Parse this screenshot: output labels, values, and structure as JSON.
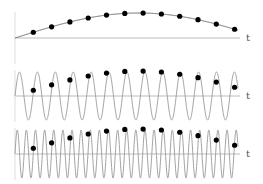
{
  "figure": {
    "panels": [
      {
        "name": "low-frequency",
        "axis_label": "t",
        "axis_y": 38,
        "amplitude_px": 25,
        "cycles_over_span": 0.45,
        "phase": 0,
        "curve_color": "#555555"
      },
      {
        "name": "medium-frequency",
        "axis_label": "t",
        "axis_y": 96,
        "amplitude_px": 24,
        "cycles_over_span": 12.45,
        "phase": 0,
        "curve_color": "#999999"
      },
      {
        "name": "high-frequency",
        "axis_label": "t",
        "axis_y": 154,
        "amplitude_px": 24,
        "cycles_over_span": 24.45,
        "phase": 0,
        "curve_color": "#999999"
      }
    ],
    "x_start": 15,
    "x_end": 238,
    "label_x": 246,
    "sample_count": 12,
    "sample_spacing_px": 18.3,
    "dot_color": "#000000",
    "axis_color": "#bbbbbb"
  }
}
